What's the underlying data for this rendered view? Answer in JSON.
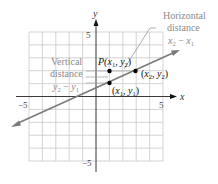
{
  "diagram": {
    "axes": {
      "x_label": "x",
      "y_label": "y",
      "x_min_label": "−5",
      "x_max_label": "5",
      "y_max_label": "5",
      "y_min_label": "−5"
    },
    "points": {
      "p": {
        "label_prefix": "P(",
        "label_x": "x",
        "label_x_sub": "1",
        "label_sep": ", ",
        "label_y": "y",
        "label_y_sub": "2",
        "label_suffix": ")"
      },
      "p2": {
        "label_open": "(",
        "label_x": "x",
        "label_x_sub": "2",
        "label_sep": ", ",
        "label_y": "y",
        "label_y_sub": "2",
        "label_close": ")"
      },
      "p1": {
        "label_open": "(",
        "label_x": "x",
        "label_x_sub": "1",
        "label_sep": ", ",
        "label_y": "y",
        "label_y_sub": "1",
        "label_close": ")"
      }
    },
    "annotations": {
      "vertical_line1": "Vertical",
      "vertical_line2": "distance",
      "vertical_formula_a": "y",
      "vertical_formula_a_sub": "2",
      "vertical_formula_op": " − ",
      "vertical_formula_b": "y",
      "vertical_formula_b_sub": "1",
      "horizontal_line1": "Horizontal",
      "horizontal_line2": "distance",
      "horizontal_formula_a": "x",
      "horizontal_formula_a_sub": "2",
      "horizontal_formula_op": " − ",
      "horizontal_formula_b": "x",
      "horizontal_formula_b_sub": "1"
    },
    "colors": {
      "grid": "#c8c8c8",
      "axis": "#222222",
      "line": "#7a7a7a",
      "annotation_text": "#8a8a8a",
      "point": "#000000"
    }
  }
}
